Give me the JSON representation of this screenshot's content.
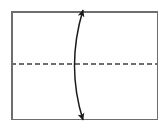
{
  "figure": {
    "title": "Rectangle with horizontal dashed fold line and curved double-headed arrow",
    "caption": "",
    "width": 168,
    "height": 129,
    "background_color": "#ffffff"
  },
  "chart_data": {
    "type": "diagram",
    "title": "Rectangle with horizontal dashed fold line and curved double-headed arrow",
    "xlabel": "",
    "ylabel": "",
    "xlim": [
      0,
      168
    ],
    "ylim": [
      0,
      129
    ],
    "grid": false,
    "legend": "none",
    "shapes": [
      {
        "name": "outer-rectangle",
        "type": "rectangle",
        "x": 11,
        "y": 11,
        "width": 147,
        "height": 109,
        "stroke": "#6e6e6e",
        "stroke_width": 1.5,
        "fill": "none",
        "line_style": "solid"
      },
      {
        "name": "horizontal-fold-line",
        "type": "line",
        "x1": 11,
        "y1": 64,
        "x2": 158,
        "y2": 64,
        "stroke": "#6e6e6e",
        "stroke_width": 1.5,
        "line_style": "dashed",
        "dash_length": 5,
        "gap_length": 3
      },
      {
        "name": "curved-double-arrow",
        "type": "curve",
        "start": [
          83,
          10
        ],
        "control": [
          66,
          66
        ],
        "end": [
          83,
          120
        ],
        "stroke": "#1a1a1a",
        "stroke_width": 1.5,
        "fill": "none",
        "arrowhead_start": true,
        "arrowhead_end": true,
        "bulge_direction": "left",
        "bulge_x": 71
      }
    ],
    "annotations": []
  },
  "colors": {
    "rectangle_stroke": "#6e6e6e",
    "dashed_line_stroke": "#6e6e6e",
    "curve_stroke": "#1a1a1a",
    "background": "#ffffff"
  }
}
